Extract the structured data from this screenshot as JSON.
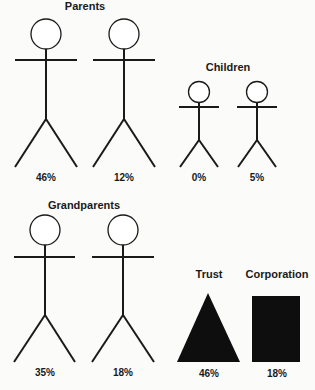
{
  "diagram": {
    "groups": [
      {
        "id": "parents",
        "title": "Parents",
        "members": [
          {
            "shape": "stick-figure",
            "size": "adult",
            "value": "46%"
          },
          {
            "shape": "stick-figure",
            "size": "adult",
            "value": "12%"
          }
        ]
      },
      {
        "id": "children",
        "title": "Children",
        "members": [
          {
            "shape": "stick-figure",
            "size": "child",
            "value": "0%"
          },
          {
            "shape": "stick-figure",
            "size": "child",
            "value": "5%"
          }
        ]
      },
      {
        "id": "grandparents",
        "title": "Grandparents",
        "members": [
          {
            "shape": "stick-figure",
            "size": "adult",
            "value": "35%"
          },
          {
            "shape": "stick-figure",
            "size": "adult",
            "value": "18%"
          }
        ]
      },
      {
        "id": "trust",
        "title": "Trust",
        "members": [
          {
            "shape": "triangle",
            "value": "46%"
          }
        ]
      },
      {
        "id": "corporation",
        "title": "Corporation",
        "members": [
          {
            "shape": "rectangle",
            "value": "18%"
          }
        ]
      }
    ],
    "colors": {
      "ink": "#1a1a1a",
      "fill": "#0e0e0e",
      "background": "#fbfbfa"
    }
  }
}
